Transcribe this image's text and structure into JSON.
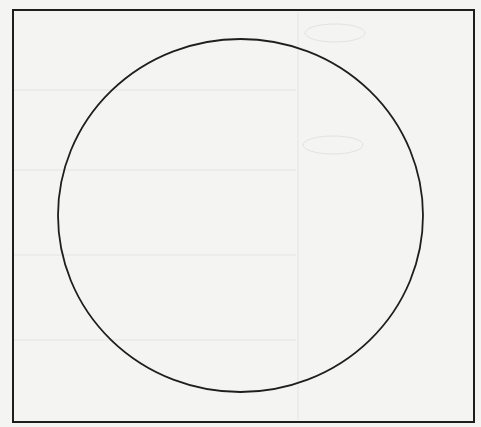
{
  "figure": {
    "shapes": [
      {
        "kind": "rectangle",
        "role": "frame"
      },
      {
        "kind": "circle",
        "role": "main-shape"
      }
    ],
    "colors": {
      "paper": "#f4f4f2",
      "stroke": "#1e1e1e",
      "bleed_through": "#d8d8d6"
    }
  }
}
